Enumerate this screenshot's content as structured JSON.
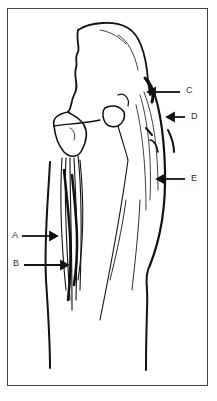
{
  "figure": {
    "type": "anatomical line drawing",
    "labels": [
      {
        "id": "A",
        "text": "A",
        "x": 12,
        "y": 231,
        "arrow_to": [
          57,
          236
        ]
      },
      {
        "id": "B",
        "text": "B",
        "x": 13,
        "y": 259,
        "arrow_to": [
          68,
          265
        ]
      },
      {
        "id": "C",
        "text": "C",
        "x": 186,
        "y": 86,
        "arrow_to": [
          148,
          92
        ]
      },
      {
        "id": "D",
        "text": "D",
        "x": 191,
        "y": 113,
        "arrow_to": [
          167,
          117
        ]
      },
      {
        "id": "E",
        "text": "E",
        "x": 191,
        "y": 173,
        "arrow_to": [
          157,
          179
        ]
      }
    ],
    "colors": {
      "ink": "#111111",
      "frame": "#444444",
      "background": "#ffffff"
    }
  }
}
